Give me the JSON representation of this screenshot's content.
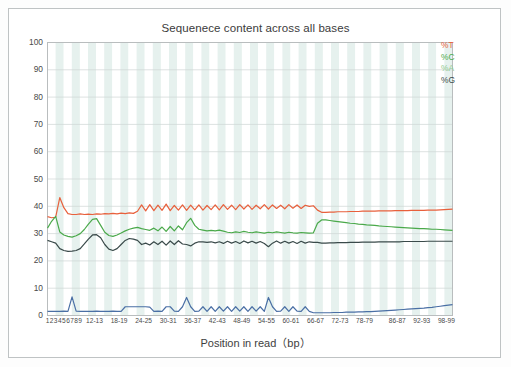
{
  "chart_data": {
    "type": "line",
    "title": "Sequenece content across all bases",
    "xlabel": "Position in read（bp）",
    "ylabel": "",
    "ylim": [
      0,
      100
    ],
    "yticks": [
      0,
      10,
      20,
      30,
      40,
      50,
      60,
      70,
      80,
      90,
      100
    ],
    "grid": true,
    "legend_position": "top-right",
    "banded_background": true,
    "xticklabels": [
      "1",
      "2",
      "3",
      "4",
      "5",
      "6",
      "7",
      "8",
      "9",
      "12-13",
      "18-19",
      "24-25",
      "30-31",
      "36-37",
      "42-43",
      "48-49",
      "54-55",
      "60-61",
      "66-67",
      "72-73",
      "78-79",
      "86-87",
      "92-93",
      "98-99"
    ],
    "xtick_positions": [
      1,
      2,
      3,
      4,
      5,
      6,
      7,
      8,
      9,
      12.5,
      18.5,
      24.5,
      30.5,
      36.5,
      42.5,
      48.5,
      54.5,
      60.5,
      66.5,
      72.5,
      78.5,
      86.5,
      92.5,
      98.5
    ],
    "x": [
      1,
      2,
      3,
      4,
      5,
      6,
      7,
      8,
      9,
      10,
      11,
      12,
      13,
      14,
      15,
      16,
      17,
      18,
      19,
      20,
      21,
      22,
      23,
      24,
      25,
      26,
      27,
      28,
      29,
      30,
      31,
      32,
      33,
      34,
      35,
      36,
      37,
      38,
      39,
      40,
      41,
      42,
      43,
      44,
      45,
      46,
      47,
      48,
      49,
      50,
      51,
      52,
      53,
      54,
      55,
      56,
      57,
      58,
      59,
      60,
      61,
      62,
      63,
      64,
      65,
      66,
      67,
      68,
      69,
      70,
      71,
      72,
      73,
      74,
      75,
      76,
      77,
      78,
      79,
      80,
      81,
      82,
      83,
      84,
      85,
      86,
      87,
      88,
      89,
      90,
      91,
      92,
      93,
      94,
      95,
      96,
      97,
      98,
      99,
      100
    ],
    "series": [
      {
        "name": "%T",
        "color": "#e8603c",
        "values": [
          36.2,
          35.8,
          36.0,
          43.2,
          39.5,
          37.3,
          37.0,
          37.0,
          37.2,
          37.0,
          37.1,
          37.0,
          37.2,
          37.1,
          37.3,
          37.2,
          37.4,
          37.2,
          37.5,
          37.3,
          37.6,
          37.4,
          38.2,
          40.5,
          38.3,
          40.6,
          38.4,
          40.4,
          38.5,
          40.8,
          38.4,
          40.3,
          38.6,
          40.5,
          38.5,
          40.4,
          38.7,
          40.5,
          38.6,
          40.3,
          38.8,
          40.5,
          38.7,
          40.6,
          38.9,
          40.4,
          38.8,
          40.6,
          39.0,
          40.5,
          38.9,
          40.4,
          39.1,
          40.6,
          39.0,
          40.5,
          39.2,
          40.4,
          39.1,
          40.6,
          39.3,
          40.5,
          39.2,
          40.4,
          40.0,
          40.2,
          38.6,
          37.8,
          37.8,
          37.9,
          37.9,
          38.0,
          38.0,
          38.0,
          38.1,
          38.1,
          38.1,
          38.2,
          38.2,
          38.2,
          38.2,
          38.3,
          38.3,
          38.3,
          38.3,
          38.4,
          38.4,
          38.4,
          38.4,
          38.5,
          38.5,
          38.5,
          38.5,
          38.6,
          38.6,
          38.6,
          38.7,
          38.8,
          38.9,
          39.0
        ]
      },
      {
        "name": "%C",
        "color": "#4aa94a",
        "values": [
          32.0,
          34.5,
          36.3,
          30.6,
          29.5,
          29.0,
          28.7,
          29.2,
          30.0,
          31.5,
          33.5,
          35.2,
          35.5,
          33.0,
          30.5,
          29.3,
          29.0,
          29.5,
          30.2,
          31.0,
          31.6,
          32.0,
          32.3,
          31.8,
          31.5,
          31.2,
          32.0,
          31.0,
          32.4,
          30.8,
          32.6,
          31.0,
          32.8,
          31.4,
          34.0,
          35.6,
          33.0,
          31.6,
          31.3,
          31.0,
          31.2,
          31.0,
          31.3,
          30.9,
          30.5,
          30.3,
          30.6,
          30.4,
          30.8,
          30.5,
          30.3,
          30.6,
          30.4,
          30.2,
          30.5,
          30.3,
          30.6,
          30.4,
          30.2,
          30.5,
          30.3,
          30.2,
          30.4,
          30.3,
          30.2,
          30.3,
          33.8,
          35.0,
          35.0,
          34.8,
          34.6,
          34.4,
          34.2,
          34.0,
          33.8,
          33.7,
          33.5,
          33.4,
          33.2,
          33.1,
          33.0,
          32.8,
          32.7,
          32.6,
          32.5,
          32.4,
          32.3,
          32.2,
          32.1,
          32.0,
          31.9,
          31.8,
          31.8,
          31.7,
          31.6,
          31.6,
          31.5,
          31.4,
          31.3,
          31.2
        ]
      },
      {
        "name": "%A",
        "color": "#4a6fa5",
        "values": [
          1.5,
          1.5,
          1.5,
          1.5,
          1.6,
          1.5,
          6.8,
          1.6,
          1.5,
          1.5,
          1.5,
          1.5,
          1.6,
          1.5,
          1.5,
          1.5,
          1.6,
          1.5,
          1.5,
          3.2,
          3.2,
          3.2,
          3.2,
          3.2,
          3.2,
          3.1,
          1.5,
          1.6,
          1.5,
          3.2,
          3.2,
          1.6,
          1.5,
          3.2,
          6.6,
          3.2,
          1.5,
          1.6,
          3.2,
          1.5,
          3.2,
          1.5,
          3.2,
          1.6,
          3.2,
          1.5,
          3.2,
          1.6,
          3.2,
          1.5,
          3.2,
          1.6,
          3.2,
          1.5,
          6.6,
          3.2,
          1.5,
          1.6,
          3.2,
          1.5,
          3.2,
          1.6,
          1.5,
          3.2,
          1.5,
          1.0,
          1.0,
          1.0,
          1.0,
          1.0,
          1.1,
          1.1,
          1.1,
          1.2,
          1.2,
          1.2,
          1.3,
          1.3,
          1.4,
          1.4,
          1.5,
          1.6,
          1.7,
          1.8,
          1.9,
          2.0,
          2.1,
          2.2,
          2.3,
          2.4,
          2.5,
          2.6,
          2.7,
          2.9,
          3.0,
          3.2,
          3.4,
          3.6,
          3.8,
          4.0
        ]
      },
      {
        "name": "%G",
        "color": "#3a4a4a",
        "values": [
          27.5,
          27.0,
          26.5,
          24.5,
          23.8,
          23.5,
          23.6,
          23.8,
          24.5,
          26.2,
          28.0,
          29.5,
          29.6,
          28.5,
          26.0,
          24.3,
          23.8,
          24.5,
          26.0,
          27.5,
          28.2,
          28.0,
          27.5,
          26.0,
          26.5,
          25.8,
          27.0,
          26.0,
          27.2,
          25.8,
          27.3,
          26.0,
          27.4,
          26.2,
          26.0,
          25.5,
          26.5,
          27.0,
          27.0,
          26.8,
          27.0,
          26.6,
          27.0,
          26.4,
          27.2,
          26.5,
          27.1,
          26.4,
          27.3,
          26.6,
          27.2,
          26.5,
          27.1,
          26.4,
          25.2,
          26.5,
          27.3,
          26.5,
          27.2,
          26.5,
          27.1,
          26.4,
          27.2,
          26.5,
          27.0,
          26.8,
          26.8,
          26.5,
          26.5,
          26.6,
          26.6,
          26.7,
          26.7,
          26.7,
          26.8,
          26.8,
          26.8,
          26.9,
          26.9,
          26.9,
          26.9,
          27.0,
          27.0,
          27.0,
          27.0,
          27.0,
          27.0,
          27.1,
          27.1,
          27.1,
          27.1,
          27.1,
          27.1,
          27.2,
          27.2,
          27.2,
          27.2,
          27.2,
          27.2,
          27.2
        ]
      }
    ],
    "legend": [
      {
        "label": "%T",
        "color": "#e8603c"
      },
      {
        "label": "%C",
        "color": "#4aa94a"
      },
      {
        "label": "%A",
        "color": "#8fc98f"
      },
      {
        "label": "%G",
        "color": "#3a4a4a"
      }
    ]
  }
}
